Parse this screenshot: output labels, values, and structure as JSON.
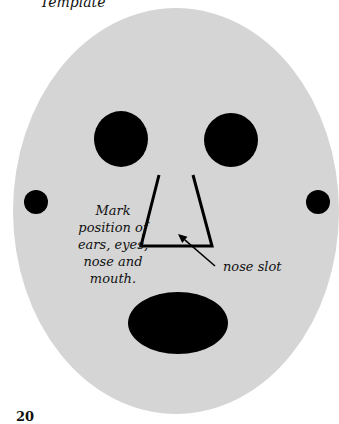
{
  "title": "Template",
  "page_number": "20",
  "colors": {
    "face": "#d5d5d5",
    "features": "#000000",
    "background": "#ffffff"
  },
  "face": {
    "cx": 176,
    "cy": 211,
    "rx": 163,
    "ry": 203
  },
  "eyes": [
    {
      "name": "left-eye",
      "cx": 121,
      "cy": 139,
      "rx": 27,
      "ry": 28
    },
    {
      "name": "right-eye",
      "cx": 231,
      "cy": 140,
      "rx": 27,
      "ry": 27
    }
  ],
  "ears": [
    {
      "name": "left-ear",
      "cx": 36,
      "cy": 202,
      "r": 12
    },
    {
      "name": "right-ear",
      "cx": 318,
      "cy": 202,
      "r": 12
    }
  ],
  "mouth": {
    "cx": 178,
    "cy": 323,
    "rx": 50,
    "ry": 31
  },
  "nose_slot": {
    "points": "159,175 141,246 212,246 193,175"
  },
  "arrow": {
    "x1": 215,
    "y1": 266,
    "x2": 178,
    "y2": 234
  },
  "labels": {
    "instructions": [
      "Mark",
      "position of",
      "ears, eyes,",
      "nose and",
      "mouth."
    ],
    "nose_slot": "nose slot"
  }
}
